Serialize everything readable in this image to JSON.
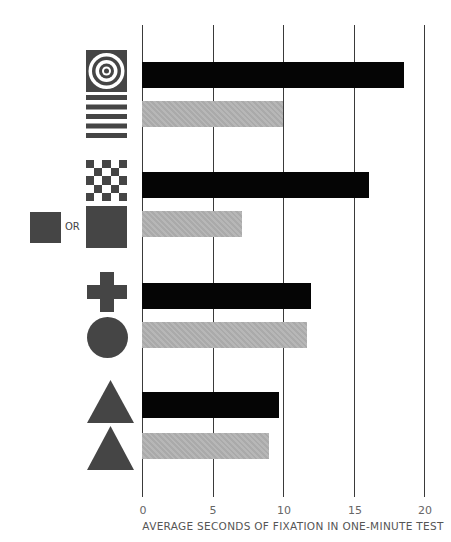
{
  "chart_data": {
    "type": "bar",
    "orientation": "horizontal",
    "title": "",
    "xlabel": "AVERAGE SECONDS OF FIXATION IN ONE-MINUTE TEST",
    "ylabel": "",
    "xlim": [
      0,
      20
    ],
    "x_ticks": [
      "0",
      "5",
      "10",
      "15",
      "20"
    ],
    "grid": true,
    "categories": [
      "bullseye (concentric circles)",
      "horizontal stripes",
      "checkerboard",
      "solid square (small or large)",
      "cross",
      "circle",
      "triangle",
      "triangle"
    ],
    "groups": [
      {
        "pair": [
          "bullseye",
          "horizontal stripes"
        ],
        "values": [
          18.6,
          10.0
        ]
      },
      {
        "pair": [
          "checkerboard",
          "solid square"
        ],
        "values": [
          16.1,
          7.1
        ]
      },
      {
        "pair": [
          "cross",
          "circle"
        ],
        "values": [
          12.0,
          11.7
        ]
      },
      {
        "pair": [
          "triangle",
          "triangle"
        ],
        "values": [
          9.7,
          9.0
        ]
      }
    ],
    "values": [
      18.6,
      10.0,
      16.1,
      7.1,
      12.0,
      11.7,
      9.7,
      9.0
    ],
    "bar_colors": [
      "#050505",
      "#b3b3b3",
      "#050505",
      "#b3b3b3",
      "#050505",
      "#b3b3b3",
      "#050505",
      "#b3b3b3"
    ],
    "legend": null
  },
  "labels": {
    "or_text": "OR",
    "ticks": [
      "0",
      "5",
      "10",
      "15",
      "20"
    ],
    "xaxis_title": "AVERAGE SECONDS OF FIXATION IN ONE-MINUTE TEST"
  },
  "colors": {
    "bar_primary": "#050505",
    "bar_secondary": "#b3b3b3",
    "icon_fill": "#454545",
    "grid": "#3a3a3a"
  }
}
